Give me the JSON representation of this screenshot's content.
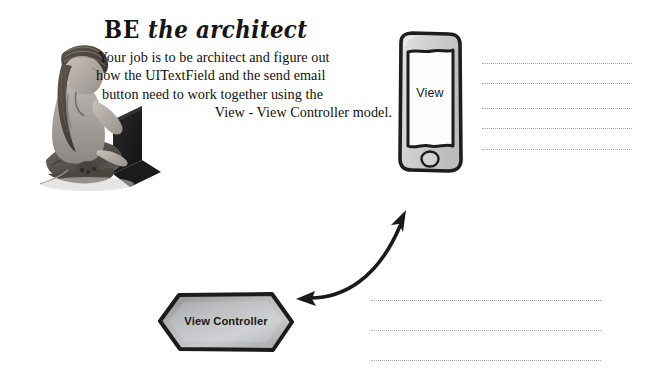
{
  "page": {
    "background_color": "#ffffff",
    "width": 657,
    "height": 385
  },
  "headline": {
    "be": "BE",
    "rest": "the architect",
    "full": "BE the architect"
  },
  "blurb": {
    "line1": "Your job is to be architect and figure out",
    "line2": "how the UITextField and the send email",
    "line3": "button need to work together using the",
    "line4": "View - View Controller model."
  },
  "photo": {
    "alt": "Photo of a person sitting cross-legged in a meditation pose beside a laptop",
    "tone": "grayscale"
  },
  "diagram": {
    "phone": {
      "label": "View",
      "shape": "hand-drawn smartphone",
      "body_color": "#d8d8d8",
      "screen_color": "#fdfdfd",
      "outline_color": "#1d1d1d"
    },
    "view_controller": {
      "label": "View Controller",
      "shape": "hexagon",
      "fill_start": "#8f9093",
      "fill_end": "#d6d7d9",
      "outline_color": "#1d1d1d"
    },
    "connector": {
      "type": "double-headed curved arrow",
      "color": "#1a1a1a",
      "from": "View Controller",
      "to": "View"
    }
  },
  "answer_lines": {
    "top_group": {
      "count": 5,
      "left": 482,
      "right": 632,
      "tops": [
        63,
        83,
        108,
        128,
        149
      ],
      "color": "#9a9a9a"
    },
    "bottom_group": {
      "count": 3,
      "left": 371,
      "right": 601,
      "tops": [
        300,
        330,
        360
      ],
      "color": "#9a9a9a"
    }
  }
}
